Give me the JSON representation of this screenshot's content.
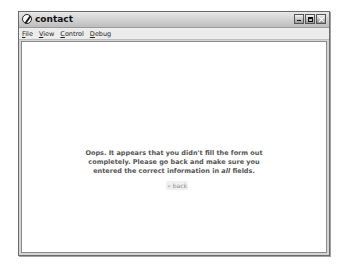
{
  "window": {
    "title": "contact",
    "icon": "compass-icon",
    "controls": [
      "minimize",
      "maximize",
      "close"
    ]
  },
  "menubar": {
    "items": [
      {
        "label": "File",
        "accel": "F",
        "rest": "ile"
      },
      {
        "label": "View",
        "accel": "V",
        "rest": "iew"
      },
      {
        "label": "Control",
        "accel": "C",
        "rest": "ontrol"
      },
      {
        "label": "Debug",
        "accel": "D",
        "rest": "ebug"
      }
    ]
  },
  "content": {
    "message_line1": "Oops.  It appears that you didn't fill the form out",
    "message_line2": "completely.  Please go back and make sure you",
    "message_line3_pre": "entered the correct information in ",
    "message_line3_em": "all",
    "message_line3_post": " fields.",
    "back_label": "« back"
  }
}
